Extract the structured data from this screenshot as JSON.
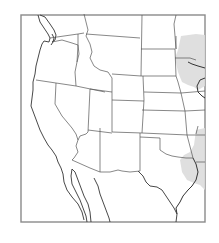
{
  "map": {
    "region": "Western United States",
    "frame_color": "#8a8a8a",
    "border_color": "#555555",
    "shaded_color": "#dcdcdc",
    "shaded_regions": [
      {
        "id": "upper-mississippi",
        "label": ""
      },
      {
        "id": "lower-mississippi",
        "label": ""
      }
    ]
  }
}
